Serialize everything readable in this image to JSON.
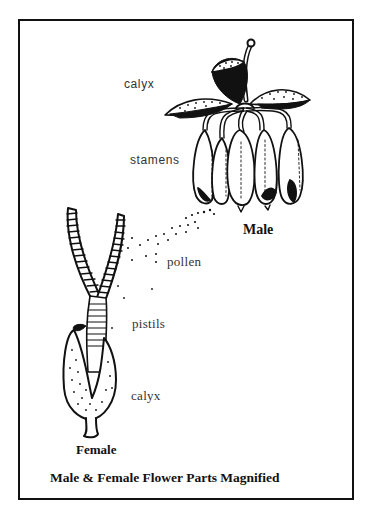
{
  "diagram": {
    "title": "Male & Female Flower Parts Magnified",
    "male": {
      "heading": "Male",
      "labels": {
        "calyx": "calyx",
        "stamens": "stamens"
      }
    },
    "female": {
      "heading": "Female",
      "labels": {
        "pistils": "pistils",
        "calyx": "calyx"
      }
    },
    "pollen_label": "pollen",
    "colors": {
      "ink": "#111111",
      "label": "#333333",
      "background": "#ffffff"
    }
  }
}
